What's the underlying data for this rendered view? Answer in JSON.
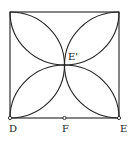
{
  "figure": {
    "type": "geometry",
    "stroke_color": "#222222",
    "background": "#ffffff",
    "square": {
      "x": 10,
      "y": 12,
      "width": 109,
      "height": 106
    },
    "center_point": {
      "x": 64.5,
      "y": 65
    },
    "points": [
      {
        "id": "D",
        "label": "D",
        "x": 10,
        "y": 118
      },
      {
        "id": "F",
        "label": "F",
        "x": 64.5,
        "y": 118
      },
      {
        "id": "E",
        "label": "E",
        "x": 119,
        "y": 118
      },
      {
        "id": "E_prime",
        "label": "E'",
        "x": 64.5,
        "y": 65
      }
    ]
  },
  "labels": {
    "d": "D",
    "f": "F",
    "e": "E",
    "e_prime": "E'"
  }
}
